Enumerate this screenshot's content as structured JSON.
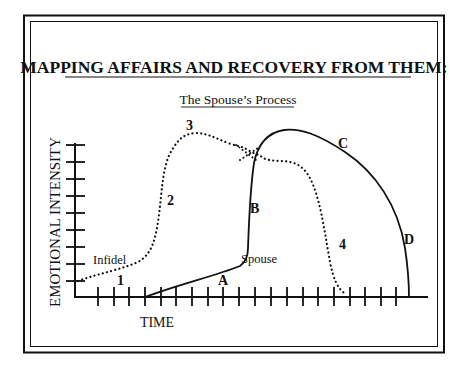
{
  "figure": {
    "title": "MAPPING AFFAIRS AND RECOVERY FROM THEM:",
    "subtitle": "The Spouse’s Process",
    "y_axis_label": "EMOTIONAL INTENSITY",
    "x_axis_label": "TIME",
    "curve_labels": {
      "infidel": "Infidel",
      "spouse": "Spouse"
    },
    "infidel_stage_labels": [
      "1",
      "2",
      "3",
      "4"
    ],
    "spouse_stage_labels": [
      "A",
      "B",
      "C",
      "D"
    ],
    "y_ticks": 9,
    "x_ticks": 20
  },
  "colors": {
    "ink": "#111111",
    "background": "#ffffff"
  }
}
